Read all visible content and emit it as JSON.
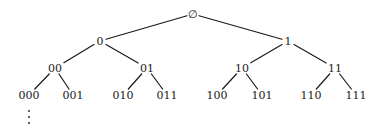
{
  "diagram": {
    "type": "binary-tree",
    "colors": {
      "background": "#ffffff",
      "ink": "#1a1a1a"
    },
    "nodes": [
      {
        "id": "root",
        "label": "∅",
        "x": 193,
        "y": 14
      },
      {
        "id": "n0",
        "label": "0",
        "x": 100,
        "y": 41
      },
      {
        "id": "n1",
        "label": "1",
        "x": 288,
        "y": 41
      },
      {
        "id": "n00",
        "label": "00",
        "x": 55,
        "y": 68
      },
      {
        "id": "n01",
        "label": "01",
        "x": 147,
        "y": 68
      },
      {
        "id": "n10",
        "label": "10",
        "x": 242,
        "y": 68
      },
      {
        "id": "n11",
        "label": "11",
        "x": 335,
        "y": 68
      },
      {
        "id": "n000",
        "label": "000",
        "x": 29,
        "y": 95
      },
      {
        "id": "n001",
        "label": "001",
        "x": 73,
        "y": 95
      },
      {
        "id": "n010",
        "label": "010",
        "x": 123,
        "y": 95
      },
      {
        "id": "n011",
        "label": "011",
        "x": 167,
        "y": 95
      },
      {
        "id": "n100",
        "label": "100",
        "x": 217,
        "y": 95
      },
      {
        "id": "n101",
        "label": "101",
        "x": 262,
        "y": 95
      },
      {
        "id": "n110",
        "label": "110",
        "x": 311,
        "y": 95
      },
      {
        "id": "n111",
        "label": "111",
        "x": 356,
        "y": 95
      }
    ],
    "edges": [
      {
        "from": "root",
        "to": "n0"
      },
      {
        "from": "root",
        "to": "n1"
      },
      {
        "from": "n0",
        "to": "n00"
      },
      {
        "from": "n0",
        "to": "n01"
      },
      {
        "from": "n1",
        "to": "n10"
      },
      {
        "from": "n1",
        "to": "n11"
      },
      {
        "from": "n00",
        "to": "n000"
      },
      {
        "from": "n00",
        "to": "n001"
      },
      {
        "from": "n01",
        "to": "n010"
      },
      {
        "from": "n01",
        "to": "n011"
      },
      {
        "from": "n10",
        "to": "n100"
      },
      {
        "from": "n10",
        "to": "n101"
      },
      {
        "from": "n11",
        "to": "n110"
      },
      {
        "from": "n11",
        "to": "n111"
      }
    ],
    "continuation": {
      "below_node": "n000",
      "symbol": "vertical-ellipsis",
      "dots": [
        {
          "x": 29,
          "y": 111
        },
        {
          "x": 29,
          "y": 117
        },
        {
          "x": 29,
          "y": 123
        }
      ]
    }
  }
}
